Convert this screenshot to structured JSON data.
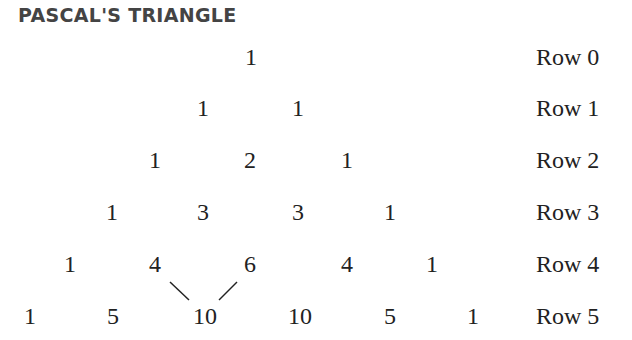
{
  "title": "PASCAL'S TRIANGLE",
  "rows": [
    {
      "label": "Row 0",
      "values": [
        "1"
      ]
    },
    {
      "label": "Row 1",
      "values": [
        "1",
        "1"
      ]
    },
    {
      "label": "Row 2",
      "values": [
        "1",
        "2",
        "1"
      ]
    },
    {
      "label": "Row 3",
      "values": [
        "1",
        "3",
        "3",
        "1"
      ]
    },
    {
      "label": "Row 4",
      "values": [
        "1",
        "4",
        "6",
        "4",
        "1"
      ]
    },
    {
      "label": "Row 5",
      "values": [
        "1",
        "5",
        "10",
        "10",
        "5",
        "1"
      ]
    }
  ],
  "annotation": "Lines connect 4 and 6 in Row 4 to 10 in Row 5"
}
